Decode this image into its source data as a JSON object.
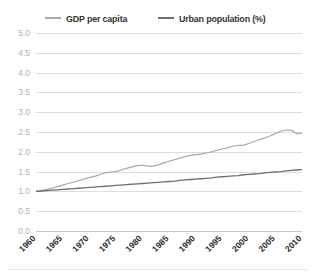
{
  "legend": {
    "position": "top-center",
    "items": [
      {
        "id": "gdp",
        "label": "GDP per capita",
        "color": "#a8a8a8"
      },
      {
        "id": "urban",
        "label": "Urban population (%)",
        "color": "#6f6f6f"
      }
    ]
  },
  "chart_data": {
    "type": "line",
    "title": "",
    "subtitle": "",
    "xlabel": "",
    "ylabel": "",
    "grid": true,
    "legend_position": "top-center",
    "xlim": [
      1960,
      2010
    ],
    "ylim": [
      0.0,
      5.0
    ],
    "ytick_labels": [
      "0.0",
      "0.5",
      "1.0",
      "1.5",
      "2.0",
      "2.5",
      "3.0",
      "3.5",
      "4.0",
      "4.5",
      "5.0"
    ],
    "yticks": [
      0.0,
      0.5,
      1.0,
      1.5,
      2.0,
      2.5,
      3.0,
      3.5,
      4.0,
      4.5,
      5.0
    ],
    "xtick_labels": [
      "1960",
      "1965",
      "1970",
      "1975",
      "1980",
      "1985",
      "1990",
      "1995",
      "2000",
      "2005",
      "2010"
    ],
    "xticks": [
      1960,
      1965,
      1970,
      1975,
      1980,
      1985,
      1990,
      1995,
      2000,
      2005,
      2010
    ],
    "x": [
      1960,
      1961,
      1962,
      1963,
      1964,
      1965,
      1966,
      1967,
      1968,
      1969,
      1970,
      1971,
      1972,
      1973,
      1974,
      1975,
      1976,
      1977,
      1978,
      1979,
      1980,
      1981,
      1982,
      1983,
      1984,
      1985,
      1986,
      1987,
      1988,
      1989,
      1990,
      1991,
      1992,
      1993,
      1994,
      1995,
      1996,
      1997,
      1998,
      1999,
      2000,
      2001,
      2002,
      2003,
      2004,
      2005,
      2006,
      2007,
      2008,
      2009,
      2010
    ],
    "series": [
      {
        "name": "GDP per capita",
        "color": "#a8a8a8",
        "values": [
          1.0,
          1.02,
          1.05,
          1.08,
          1.12,
          1.16,
          1.2,
          1.23,
          1.27,
          1.31,
          1.35,
          1.38,
          1.42,
          1.47,
          1.49,
          1.5,
          1.54,
          1.58,
          1.62,
          1.65,
          1.66,
          1.64,
          1.64,
          1.67,
          1.72,
          1.76,
          1.8,
          1.84,
          1.88,
          1.91,
          1.93,
          1.94,
          1.97,
          2.0,
          2.04,
          2.07,
          2.1,
          2.14,
          2.16,
          2.17,
          2.21,
          2.26,
          2.31,
          2.35,
          2.4,
          2.46,
          2.52,
          2.55,
          2.54,
          2.46,
          2.47
        ]
      },
      {
        "name": "Urban population (%)",
        "color": "#6f6f6f",
        "values": [
          1.0,
          1.01,
          1.02,
          1.03,
          1.04,
          1.05,
          1.06,
          1.07,
          1.08,
          1.09,
          1.1,
          1.11,
          1.12,
          1.13,
          1.14,
          1.15,
          1.16,
          1.17,
          1.18,
          1.19,
          1.2,
          1.21,
          1.22,
          1.23,
          1.24,
          1.25,
          1.26,
          1.28,
          1.29,
          1.3,
          1.31,
          1.32,
          1.33,
          1.34,
          1.36,
          1.37,
          1.38,
          1.39,
          1.4,
          1.42,
          1.43,
          1.44,
          1.45,
          1.47,
          1.48,
          1.49,
          1.5,
          1.52,
          1.53,
          1.54,
          1.55
        ]
      }
    ]
  }
}
